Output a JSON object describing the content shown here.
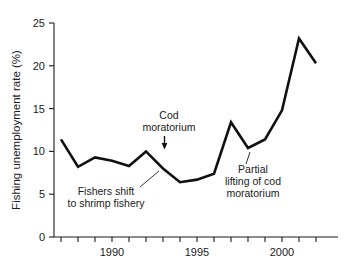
{
  "chart_data": {
    "type": "line",
    "title": "",
    "xlabel": "",
    "ylabel": "Fishing unemployment rate (%)",
    "xlim": [
      1986.6,
      2002.4
    ],
    "ylim": [
      0,
      25
    ],
    "grid": false,
    "legend": "none",
    "line_color": "#111111",
    "x": [
      1987,
      1988,
      1989,
      1990,
      1991,
      1992,
      1993,
      1994,
      1995,
      1996,
      1997,
      1998,
      1999,
      2000,
      2001,
      2002
    ],
    "values": [
      11.4,
      8.2,
      9.3,
      8.9,
      8.3,
      10.0,
      8.0,
      6.4,
      6.7,
      7.4,
      13.4,
      10.4,
      11.4,
      14.8,
      23.2,
      20.3
    ],
    "y_ticks": [
      0,
      5,
      10,
      15,
      20,
      25
    ],
    "y_tick_labels": [
      "0",
      "5",
      "10",
      "15",
      "20",
      "25"
    ],
    "x_ticks": [
      1987,
      1988,
      1989,
      1990,
      1991,
      1992,
      1993,
      1994,
      1995,
      1996,
      1997,
      1998,
      1999,
      2000,
      2001,
      2002
    ],
    "x_tick_labels_shown": [
      {
        "value": 1990,
        "label": "1990"
      },
      {
        "value": 1995,
        "label": "1995"
      },
      {
        "value": 2000,
        "label": "2000"
      }
    ],
    "annotations": [
      {
        "id": "cod-moratorium",
        "lines": [
          "Cod",
          "moratorium"
        ],
        "target_x": 1992,
        "target_y": 10.0,
        "marker": "down-arrow"
      },
      {
        "id": "fishers-shift",
        "lines": [
          "Fishers shift",
          "to shrimp fishery"
        ],
        "target_x": 1992.6,
        "target_y": 9.2,
        "marker": "leader-line"
      },
      {
        "id": "partial-lifting",
        "lines": [
          "Partial",
          "lifting of cod",
          "moratorium"
        ],
        "target_x": 1998,
        "target_y": 10.4,
        "marker": "leader-line"
      }
    ]
  }
}
